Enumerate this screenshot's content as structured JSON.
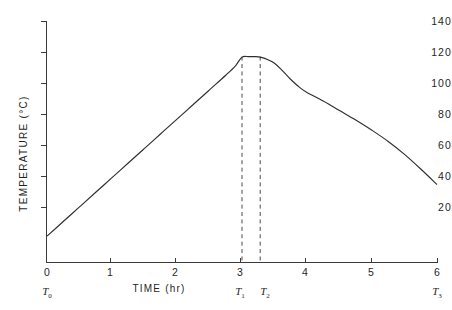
{
  "chart_data": {
    "type": "line",
    "title": "",
    "xlabel": "TIME (hr)",
    "ylabel": "TEMPERATURE (°C)",
    "xlim": [
      0,
      6
    ],
    "ylim": [
      0,
      140
    ],
    "grid": false,
    "legend": "none",
    "x_ticks": [
      {
        "value": 0,
        "label": "0"
      },
      {
        "value": 1,
        "label": "1"
      },
      {
        "value": 2,
        "label": "2"
      },
      {
        "value": 3,
        "label": "3"
      },
      {
        "value": 4,
        "label": "4"
      },
      {
        "value": 5,
        "label": "5"
      },
      {
        "value": 6,
        "label": "6"
      }
    ],
    "y_ticks": [
      {
        "value": 0,
        "label": "0"
      },
      {
        "value": 20,
        "label": "20"
      },
      {
        "value": 40,
        "label": "40"
      },
      {
        "value": 60,
        "label": "60"
      },
      {
        "value": 80,
        "label": "80"
      },
      {
        "value": 100,
        "label": "100"
      },
      {
        "value": 120,
        "label": "120"
      },
      {
        "value": 140,
        "label": "140"
      }
    ],
    "series": [
      {
        "name": "temperature profile",
        "x": [
          0.0,
          0.25,
          0.5,
          0.75,
          1.0,
          1.25,
          1.5,
          1.75,
          2.0,
          2.25,
          2.5,
          2.75,
          2.9,
          3.0,
          3.1,
          3.2,
          3.28,
          3.4,
          3.5,
          3.6,
          3.75,
          3.9,
          4.0,
          4.25,
          4.5,
          4.75,
          5.0,
          5.25,
          5.5,
          5.75,
          6.0
        ],
        "y": [
          15.0,
          23.5,
          32.0,
          40.5,
          49.0,
          57.5,
          66.0,
          74.5,
          83.0,
          91.5,
          100.0,
          108.5,
          114.0,
          119.0,
          119.3,
          119.3,
          119.0,
          117.5,
          115.5,
          112.0,
          106.0,
          101.0,
          98.5,
          93.5,
          88.0,
          82.5,
          76.5,
          70.0,
          62.5,
          54.0,
          45.0
        ]
      }
    ],
    "annotations": [
      {
        "name": "T0",
        "label": "T",
        "sub": "0",
        "x": 0.0,
        "type": "axis-marker"
      },
      {
        "name": "T1",
        "label": "T",
        "sub": "1",
        "x": 3.0,
        "type": "vertical-dashed-line",
        "y_top": 119.3
      },
      {
        "name": "T2",
        "label": "T",
        "sub": "2",
        "x": 3.28,
        "type": "vertical-dashed-line",
        "y_top": 119.3
      },
      {
        "name": "T3",
        "label": "T",
        "sub": "3",
        "x": 6.0,
        "type": "axis-marker"
      }
    ],
    "notes": {
      "plateau_temperature": 119,
      "plateau_start_hr": 3.0,
      "plateau_end_hr": 3.28,
      "start_temperature": 15,
      "end_temperature": 45
    },
    "colors": {
      "curve": "#2e2e2e",
      "axis": "#3a3a3a",
      "dashed_line": "#4a4a4a",
      "background": "#ffffff"
    }
  }
}
